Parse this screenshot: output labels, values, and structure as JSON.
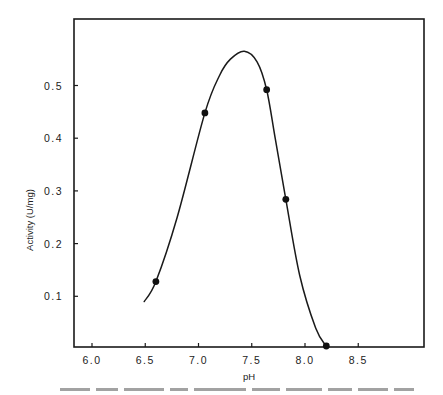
{
  "chart_data": {
    "type": "line",
    "title": "",
    "xlabel": "pH",
    "ylabel": "Activity (U/mg)",
    "xlim": [
      5.85,
      9.15
    ],
    "ylim": [
      0.0,
      0.62
    ],
    "grid": false,
    "legend": null,
    "x_ticks": [
      6.0,
      6.5,
      7.0,
      7.5,
      8.0,
      8.5
    ],
    "x_tick_labels": [
      "6.0",
      "6.5",
      "7.0",
      "7.5",
      "8.0",
      "8.5"
    ],
    "y_ticks": [
      0.1,
      0.2,
      0.3,
      0.4,
      0.5
    ],
    "y_tick_labels": [
      "0.1",
      "0.2",
      "0.3",
      "0.4",
      "0.5"
    ],
    "series": [
      {
        "name": "measured",
        "style": "markers",
        "x": [
          6.6,
          7.06,
          7.64,
          7.82,
          8.2
        ],
        "y": [
          0.128,
          0.448,
          0.492,
          0.284,
          0.005
        ]
      },
      {
        "name": "fitted curve",
        "style": "smooth-line",
        "x": [
          6.49,
          6.6,
          6.8,
          7.06,
          7.2,
          7.3,
          7.43,
          7.55,
          7.64,
          7.72,
          7.82,
          7.95,
          8.1,
          8.2
        ],
        "y": [
          0.09,
          0.128,
          0.25,
          0.448,
          0.52,
          0.55,
          0.565,
          0.545,
          0.492,
          0.4,
          0.284,
          0.14,
          0.04,
          0.005
        ]
      }
    ],
    "annotations": []
  },
  "axes": {
    "xlabel": "pH",
    "ylabel": "Activity (U/mg)"
  }
}
